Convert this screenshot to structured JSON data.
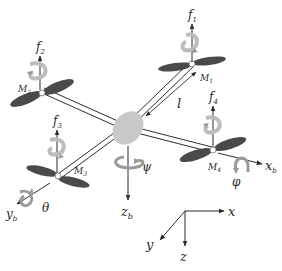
{
  "diagram": {
    "colors": {
      "background": "#ffffff",
      "body": "#c9c9c9",
      "propeller": "#4a4a4a",
      "arm": "#2e2e2e",
      "rotation_arrow": "#bdbdbd",
      "text": "#2b2b2b"
    },
    "rotors": [
      {
        "id": "M1",
        "motor_label": "M",
        "motor_sub": "1",
        "force_label": "f",
        "force_sub": "1"
      },
      {
        "id": "M2",
        "motor_label": "M",
        "motor_sub": "2",
        "force_label": "f",
        "force_sub": "2"
      },
      {
        "id": "M3",
        "motor_label": "M",
        "motor_sub": "3",
        "force_label": "f",
        "force_sub": "3"
      },
      {
        "id": "M4",
        "motor_label": "M",
        "motor_sub": "4",
        "force_label": "f",
        "force_sub": "4"
      }
    ],
    "arm_length_label": "l",
    "body_axes": {
      "x": {
        "label": "x",
        "sub": "b",
        "rotation": "φ"
      },
      "y": {
        "label": "y",
        "sub": "b",
        "rotation": "θ"
      },
      "z": {
        "label": "z",
        "sub": "b",
        "rotation": "ψ"
      }
    },
    "inertial_frame": {
      "x_label": "x",
      "y_label": "y",
      "z_label": "z"
    }
  }
}
